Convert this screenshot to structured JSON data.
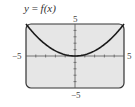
{
  "chart_data": {
    "type": "line",
    "title": "y = f(x)",
    "function": "y = x^2 / 5",
    "series": [
      {
        "name": "f(x)",
        "x": [
          -5,
          -4,
          -3,
          -2,
          -1,
          0,
          1,
          2,
          3,
          4,
          5
        ],
        "y": [
          5,
          3.2,
          1.8,
          0.8,
          0.2,
          0,
          0.2,
          0.8,
          1.8,
          3.2,
          5
        ]
      }
    ],
    "xlim": [
      -5,
      5
    ],
    "ylim": [
      -5,
      5
    ],
    "xlabel": "",
    "ylabel": "",
    "tick_labels": {
      "x_min": "−5",
      "x_max": "5",
      "y_min": "−5",
      "y_max": "5"
    },
    "x_tick_step": 1,
    "y_tick_step": 1,
    "grid": false,
    "legend": null,
    "colors": {
      "background": "#e6e6e6",
      "curve": "#1a1a1a",
      "frame": "#333333",
      "axis": "#555555"
    }
  },
  "title": {
    "lhs": "y",
    "eq": " = ",
    "rhs": "f(x)"
  },
  "labels": {
    "top": "5",
    "bottom": "−5",
    "left": "−5",
    "right": "5"
  }
}
